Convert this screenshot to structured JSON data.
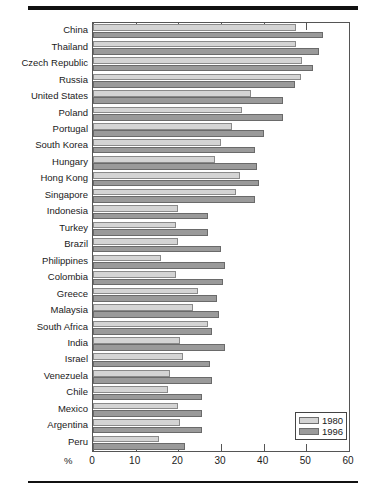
{
  "chart_data": {
    "type": "bar",
    "orientation": "horizontal",
    "title": "",
    "subtitle": "",
    "xlabel": "%",
    "ylabel": "",
    "xlim": [
      0,
      60
    ],
    "xticks": [
      0,
      10,
      20,
      30,
      40,
      50,
      60
    ],
    "xtick_labels": [
      "0",
      "10",
      "20",
      "30",
      "40",
      "50",
      "60"
    ],
    "grid": false,
    "legend_position": "bottom-right",
    "categories": [
      "China",
      "Thailand",
      "Czech Republic",
      "Russia",
      "United States",
      "Poland",
      "Portugal",
      "South Korea",
      "Hungary",
      "Hong Kong",
      "Singapore",
      "Indonesia",
      "Turkey",
      "Brazil",
      "Philippines",
      "Colombia",
      "Greece",
      "Malaysia",
      "South Africa",
      "India",
      "Israel",
      "Venezuela",
      "Chile",
      "Mexico",
      "Argentina",
      "Peru"
    ],
    "series": [
      {
        "name": "1980",
        "color": "#d4d4d4",
        "values": [
          47.5,
          47.5,
          49.0,
          48.8,
          37.0,
          35.0,
          32.5,
          30.0,
          28.5,
          34.5,
          33.5,
          20.0,
          19.5,
          20.0,
          16.0,
          19.5,
          24.5,
          23.5,
          27.0,
          20.5,
          21.0,
          18.0,
          17.5,
          20.0,
          20.5,
          15.5
        ]
      },
      {
        "name": "1996",
        "color": "#9a9a9a",
        "values": [
          54.0,
          53.0,
          51.5,
          47.4,
          44.5,
          44.5,
          40.0,
          38.0,
          38.5,
          39.0,
          38.0,
          27.0,
          27.0,
          30.0,
          31.0,
          30.5,
          29.0,
          29.5,
          28.0,
          31.0,
          27.5,
          28.0,
          25.5,
          25.5,
          25.5,
          21.5
        ]
      }
    ]
  },
  "legend": {
    "entries": [
      {
        "label": "1980"
      },
      {
        "label": "1996"
      }
    ]
  },
  "axis": {
    "unit_label": "%"
  }
}
